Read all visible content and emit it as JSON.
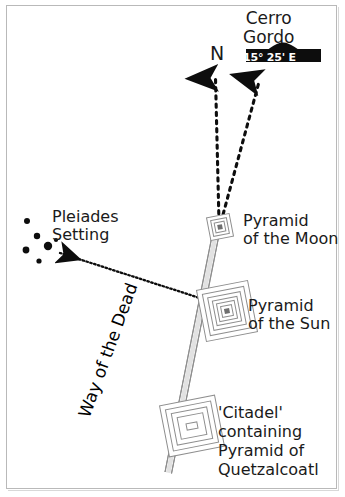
{
  "figure": {
    "type": "archaeological-site-alignment-diagram",
    "background_color": "#ffffff",
    "border_color": "#b9b9b9",
    "ink_color": "#1a1a1a"
  },
  "labels": {
    "cerro_gordo_line1": "Cerro",
    "cerro_gordo_line2": "Gordo",
    "bearing": "15° 25' E",
    "north": "N",
    "pleiades_line1": "Pleiades",
    "pleiades_line2": "Setting",
    "moon_line1": "Pyramid",
    "moon_line2": "of the Moon",
    "sun_line1": "Pyramid",
    "sun_line2": "of the Sun",
    "citadel_line1": "'Citadel'",
    "citadel_line2": "containing",
    "citadel_line3": "Pyramid of",
    "citadel_line4": "Quetzalcoatl",
    "avenue": "Way of the Dead"
  },
  "features": {
    "pyramid_of_the_moon": {
      "name": "Pyramid of the Moon",
      "x": 220,
      "y": 227,
      "glyph": "nested-squares-small"
    },
    "pyramid_of_the_sun": {
      "name": "Pyramid of the Sun",
      "x": 227,
      "y": 310,
      "glyph": "nested-squares-large"
    },
    "citadel": {
      "name": "'Citadel' containing Pyramid of Quetzalcoatl",
      "x": 192,
      "y": 425,
      "glyph": "nested-rectangles"
    },
    "cerro_gordo_hill": {
      "name": "Cerro Gordo",
      "x": 283,
      "y": 52,
      "glyph": "hill-silhouette"
    }
  },
  "alignments": [
    {
      "name": "true-north",
      "from": "Pyramid of the Moon",
      "to": "N",
      "style": "dotted-arrow",
      "bearing_label": "N"
    },
    {
      "name": "cerro-gordo-sightline",
      "from": "Pyramid of the Moon",
      "to": "Cerro Gordo",
      "style": "dotted-arrow",
      "bearing_label": "15° 25' E"
    },
    {
      "name": "pleiades-setting-sightline",
      "from": "Pyramid of the Sun",
      "to": "Pleiades Setting",
      "style": "fine-dotted-arrow"
    }
  ],
  "stars": {
    "cluster_name": "Pleiades",
    "points": [
      {
        "x": 27,
        "y": 221,
        "r": 3.0
      },
      {
        "x": 37,
        "y": 236,
        "r": 3.2
      },
      {
        "x": 26,
        "y": 250,
        "r": 3.4
      },
      {
        "x": 48,
        "y": 246,
        "r": 4.2
      },
      {
        "x": 55,
        "y": 240,
        "r": 2.2
      },
      {
        "x": 39,
        "y": 261,
        "r": 2.6
      }
    ]
  },
  "avenue": {
    "name": "Way of the Dead",
    "style": "double-line-band",
    "from": {
      "x": 216,
      "y": 232
    },
    "to": {
      "x": 168,
      "y": 470
    }
  }
}
